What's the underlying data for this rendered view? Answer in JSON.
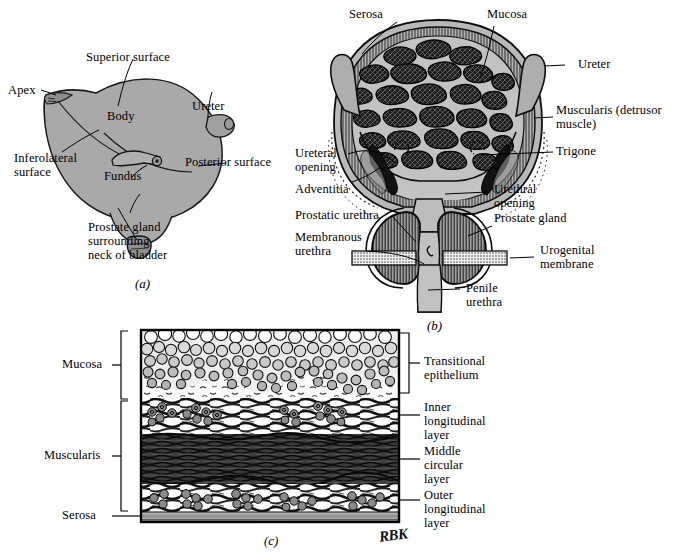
{
  "figure": {
    "title_semantic": "urinary-bladder-anatomy-plate",
    "signature": "RBK",
    "colors": {
      "ink": "#000000",
      "paper": "#ffffff",
      "organ_gray": "#a9a9a9",
      "organ_gray_dark": "#8f8f8f",
      "lumen_gray": "#bcbcbc",
      "muscle_dark": "#2b2b2b",
      "muscle_mid": "#555555",
      "serosa_gray": "#9a9a9a",
      "hatch_gray": "#6f6f6f"
    }
  },
  "panels": [
    {
      "id": "a",
      "caption": "(a)",
      "name": "gross-bladder-external-view",
      "labels": [
        {
          "key": "superior_surface",
          "text": "Superior surface"
        },
        {
          "key": "apex",
          "text": "Apex"
        },
        {
          "key": "body",
          "text": "Body"
        },
        {
          "key": "ureter",
          "text": "Ureter"
        },
        {
          "key": "posterior_surface",
          "text": "Posterior surface"
        },
        {
          "key": "inferolateral_surface_l1",
          "text": "Inferolateral"
        },
        {
          "key": "inferolateral_surface_l2",
          "text": "surface"
        },
        {
          "key": "fundus",
          "text": "Fundus"
        },
        {
          "key": "prostate_l1",
          "text": "Prostate gland"
        },
        {
          "key": "prostate_l2",
          "text": "surrounding"
        },
        {
          "key": "prostate_l3",
          "text": "neck of bladder"
        }
      ]
    },
    {
      "id": "b",
      "caption": "(b)",
      "name": "bladder-coronal-section",
      "labels": [
        {
          "key": "serosa",
          "text": "Serosa"
        },
        {
          "key": "mucosa",
          "text": "Mucosa"
        },
        {
          "key": "ureter",
          "text": "Ureter"
        },
        {
          "key": "muscularis_l1",
          "text": "Muscularis (detrusor"
        },
        {
          "key": "muscularis_l2",
          "text": "muscle)"
        },
        {
          "key": "trigone",
          "text": "Trigone"
        },
        {
          "key": "ureteral_opening_l1",
          "text": "Ureteral"
        },
        {
          "key": "ureteral_opening_l2",
          "text": "opening"
        },
        {
          "key": "adventitia",
          "text": "Adventitia"
        },
        {
          "key": "urethral_opening_l1",
          "text": "Urethral"
        },
        {
          "key": "urethral_opening_l2",
          "text": "opening"
        },
        {
          "key": "prostatic_urethra",
          "text": "Prostatic urethra"
        },
        {
          "key": "prostate_gland",
          "text": "Prostate gland"
        },
        {
          "key": "membranous_l1",
          "text": "Membranous"
        },
        {
          "key": "membranous_l2",
          "text": "urethra"
        },
        {
          "key": "urogenital_l1",
          "text": "Urogenital"
        },
        {
          "key": "urogenital_l2",
          "text": "membrane"
        },
        {
          "key": "penile_l1",
          "text": "Penile"
        },
        {
          "key": "penile_l2",
          "text": "urethra"
        }
      ]
    },
    {
      "id": "c",
      "caption": "(c)",
      "name": "bladder-wall-histology",
      "labels": [
        {
          "key": "mucosa",
          "text": "Mucosa"
        },
        {
          "key": "muscularis",
          "text": "Muscularis"
        },
        {
          "key": "serosa",
          "text": "Serosa"
        },
        {
          "key": "transitional_l1",
          "text": "Transitional"
        },
        {
          "key": "transitional_l2",
          "text": "epithelium"
        },
        {
          "key": "inner_l1",
          "text": "Inner"
        },
        {
          "key": "inner_l2",
          "text": "longitudinal"
        },
        {
          "key": "inner_l3",
          "text": "layer"
        },
        {
          "key": "middle_l1",
          "text": "Middle"
        },
        {
          "key": "middle_l2",
          "text": "circular"
        },
        {
          "key": "middle_l3",
          "text": "layer"
        },
        {
          "key": "outer_l1",
          "text": "Outer"
        },
        {
          "key": "outer_l2",
          "text": "longitudinal"
        },
        {
          "key": "outer_l3",
          "text": "layer"
        }
      ]
    }
  ]
}
